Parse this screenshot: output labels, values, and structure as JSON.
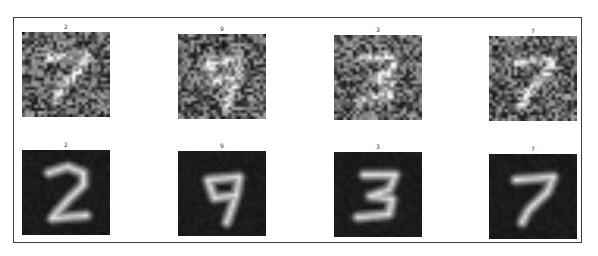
{
  "figure": {
    "rows": [
      {
        "name": "noisy-input",
        "style": "noisy",
        "images": [
          {
            "label": "2",
            "digit": "7",
            "x": 22,
            "y": 32
          },
          {
            "label": "9",
            "digit": "9",
            "x": 178,
            "y": 34
          },
          {
            "label": "3",
            "digit": "3",
            "x": 334,
            "y": 35
          },
          {
            "label": "7",
            "digit": "7",
            "x": 489,
            "y": 36
          }
        ]
      },
      {
        "name": "denoised-output",
        "style": "clean",
        "images": [
          {
            "label": "2",
            "digit": "2",
            "x": 22,
            "y": 150
          },
          {
            "label": "9",
            "digit": "9",
            "x": 178,
            "y": 151
          },
          {
            "label": "3",
            "digit": "3",
            "x": 334,
            "y": 152
          },
          {
            "label": "7",
            "digit": "7",
            "x": 489,
            "y": 154
          }
        ]
      }
    ]
  }
}
